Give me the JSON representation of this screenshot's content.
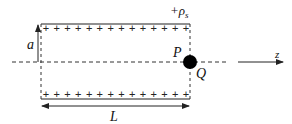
{
  "diagram": {
    "labels": {
      "surface_charge": "+ρ",
      "surface_charge_sub": "s",
      "radius": "a",
      "length": "L",
      "point_p": "P",
      "point_q": "Q",
      "axis": "z"
    },
    "charges": {
      "top_count": 14,
      "bottom_count": 14,
      "symbol": "+"
    },
    "colors": {
      "stroke": "#222222",
      "dot": "#000000",
      "background": "#ffffff"
    }
  }
}
